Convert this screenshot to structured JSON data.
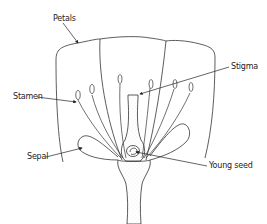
{
  "diagram": {
    "type": "labeled-illustration",
    "labels": [
      {
        "id": "petals",
        "text": "Petals",
        "x": 53,
        "y": 15
      },
      {
        "id": "stigma",
        "text": "Stigma",
        "x": 231,
        "y": 63
      },
      {
        "id": "stamen",
        "text": "Stamen",
        "x": 13,
        "y": 93
      },
      {
        "id": "sepal",
        "text": "Sepal",
        "x": 27,
        "y": 153
      },
      {
        "id": "young_seed",
        "text": "Young seed",
        "x": 209,
        "y": 162
      }
    ],
    "colors": {
      "line": "#333333",
      "background": "#ffffff",
      "stipple": "#9a9a9a"
    }
  }
}
